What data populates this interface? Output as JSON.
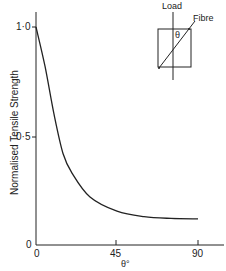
{
  "chart_data": {
    "type": "line",
    "title": "",
    "xlabel": "θ°",
    "ylabel": "Normalised Tensile Strength",
    "xlim": [
      0,
      90
    ],
    "ylim": [
      0,
      1.0
    ],
    "x_ticks": [
      "0",
      "45",
      "90"
    ],
    "y_ticks": [
      "0",
      "0·5",
      "1·0"
    ],
    "grid": false,
    "legend": null,
    "series": [
      {
        "name": "Normalised Tensile Strength",
        "x": [
          0,
          5,
          10,
          15,
          20,
          30,
          45,
          60,
          75,
          90
        ],
        "y": [
          1.0,
          0.82,
          0.6,
          0.42,
          0.33,
          0.22,
          0.155,
          0.13,
          0.122,
          0.12
        ]
      }
    ],
    "annotations": {
      "inset": {
        "load_label": "Load",
        "fibre_label": "Fibre",
        "angle_label": "θ"
      }
    }
  }
}
